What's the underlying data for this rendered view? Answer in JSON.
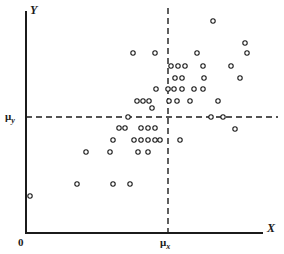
{
  "chart_data": {
    "type": "scatter",
    "title": "",
    "xlabel": "X",
    "ylabel": "Y",
    "origin_label": "0",
    "grid": false,
    "legend": null,
    "xlim": [
      0,
      284
    ],
    "ylim": [
      0,
      254
    ],
    "marker": {
      "shape": "open-circle",
      "radius": 2.2,
      "stroke": "#1b1b1b",
      "fill": "#ffffff",
      "stroke_width": 1.1
    },
    "reference_lines": [
      {
        "name": "mu-x-line",
        "orientation": "vertical",
        "label": "μ",
        "label_subscript": "x",
        "value_px": 168,
        "from_px": 8,
        "to_px": 233,
        "style": "dashed",
        "color": "#1b1b1b"
      },
      {
        "name": "mu-y-line",
        "orientation": "horizontal",
        "label": "μ",
        "label_subscript": "y",
        "value_px": 117,
        "from_px": 26,
        "to_px": 278,
        "style": "dashed",
        "color": "#1b1b1b"
      }
    ],
    "axes": {
      "x_axis_y_px": 233,
      "y_axis_x_px": 26,
      "x_axis_from_px": 26,
      "x_axis_to_px": 262,
      "y_axis_from_px": 12,
      "y_axis_to_px": 233,
      "color": "#1b1b1b",
      "width": 2
    },
    "points": [
      [
        30,
        196
      ],
      [
        77,
        184
      ],
      [
        113,
        184
      ],
      [
        130,
        184
      ],
      [
        86,
        152
      ],
      [
        110,
        152
      ],
      [
        138,
        152
      ],
      [
        148,
        152
      ],
      [
        113,
        140
      ],
      [
        134,
        140
      ],
      [
        141,
        140
      ],
      [
        148,
        140
      ],
      [
        155,
        140
      ],
      [
        160,
        140
      ],
      [
        180,
        140
      ],
      [
        119,
        128
      ],
      [
        125,
        128
      ],
      [
        141,
        128
      ],
      [
        148,
        128
      ],
      [
        155,
        128
      ],
      [
        235,
        129
      ],
      [
        128,
        117
      ],
      [
        211,
        117
      ],
      [
        223,
        117
      ],
      [
        152,
        108
      ],
      [
        137,
        101
      ],
      [
        143,
        101
      ],
      [
        149,
        101
      ],
      [
        169,
        101
      ],
      [
        177,
        101
      ],
      [
        190,
        101
      ],
      [
        218,
        101
      ],
      [
        156,
        89
      ],
      [
        168,
        89
      ],
      [
        174,
        89
      ],
      [
        182,
        89
      ],
      [
        194,
        89
      ],
      [
        203,
        89
      ],
      [
        175,
        78
      ],
      [
        182,
        78
      ],
      [
        204,
        78
      ],
      [
        240,
        78
      ],
      [
        171,
        66
      ],
      [
        178,
        66
      ],
      [
        185,
        66
      ],
      [
        203,
        66
      ],
      [
        231,
        66
      ],
      [
        133,
        53
      ],
      [
        155,
        53
      ],
      [
        197,
        53
      ],
      [
        247,
        53
      ],
      [
        245,
        43
      ],
      [
        213,
        21
      ]
    ]
  }
}
